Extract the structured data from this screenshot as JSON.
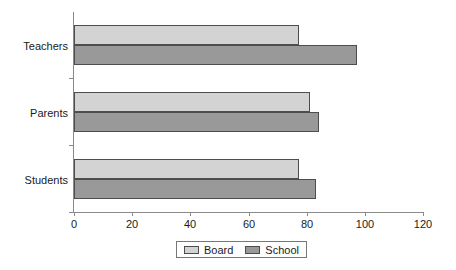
{
  "chart_data": {
    "type": "bar",
    "orientation": "horizontal",
    "title": "",
    "xlabel": "",
    "ylabel": "",
    "categories": [
      "Teachers",
      "Parents",
      "Students"
    ],
    "series": [
      {
        "name": "Board",
        "values": [
          77,
          81,
          77
        ],
        "color": "#d3d3d3"
      },
      {
        "name": "School",
        "values": [
          97,
          84,
          83
        ],
        "color": "#999999"
      }
    ],
    "xlim": [
      0,
      120
    ],
    "xticks": [
      0,
      20,
      40,
      60,
      80,
      100,
      120
    ],
    "xtick_labels": [
      "0",
      "20",
      "40",
      "60",
      "80",
      "100",
      "120"
    ],
    "grid": false,
    "legend_position": "bottom"
  },
  "axis": {
    "tick_labels": [
      "0",
      "20",
      "40",
      "60",
      "80",
      "100",
      "120"
    ]
  },
  "categories": {
    "teachers": "Teachers",
    "parents": "Parents",
    "students": "Students"
  },
  "legend": {
    "items": [
      {
        "label": "Board"
      },
      {
        "label": "School"
      }
    ]
  },
  "colors": {
    "board": "#d3d3d3",
    "school": "#999999",
    "axis": "#8a8a8a",
    "bar_border": "#4d4d4d",
    "background": "#ffffff"
  }
}
